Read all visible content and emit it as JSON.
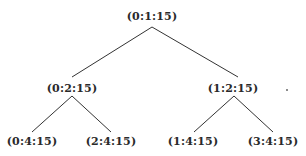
{
  "diagram": {
    "type": "binary-tree",
    "nodes": {
      "root": {
        "label": "(0:1:15)",
        "x": 152,
        "y": 16
      },
      "l": {
        "label": "(0:2:15)",
        "x": 72,
        "y": 88
      },
      "r": {
        "label": "(1:2:15)",
        "x": 233,
        "y": 88
      },
      "ll": {
        "label": "(0:4:15)",
        "x": 32,
        "y": 141
      },
      "lr": {
        "label": "(2:4:15)",
        "x": 111,
        "y": 141
      },
      "rl": {
        "label": "(1:4:15)",
        "x": 193,
        "y": 141
      },
      "rr": {
        "label": "(3:4:15)",
        "x": 273,
        "y": 141
      }
    },
    "edges": [
      {
        "from": "root",
        "to": "l"
      },
      {
        "from": "root",
        "to": "r"
      },
      {
        "from": "l",
        "to": "ll"
      },
      {
        "from": "l",
        "to": "lr"
      },
      {
        "from": "r",
        "to": "rl"
      },
      {
        "from": "r",
        "to": "rr"
      }
    ]
  }
}
